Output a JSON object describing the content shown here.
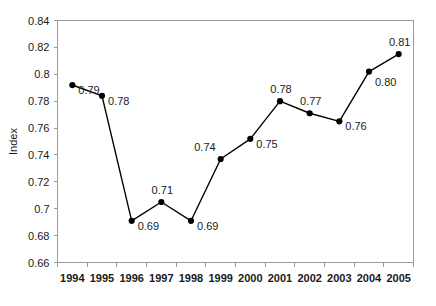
{
  "chart_data": {
    "type": "line",
    "title": "",
    "xlabel": "",
    "ylabel": "Index",
    "categories": [
      "1994",
      "1995",
      "1996",
      "1997",
      "1998",
      "1999",
      "2000",
      "2001",
      "2002",
      "2003",
      "2004",
      "2005"
    ],
    "values": [
      0.792,
      0.784,
      0.691,
      0.705,
      0.691,
      0.737,
      0.752,
      0.78,
      0.771,
      0.765,
      0.802,
      0.815
    ],
    "point_labels": [
      "0.79",
      "0.78",
      "0.69",
      "0.71",
      "0.69",
      "0.74",
      "0.75",
      "0.78",
      "0.77",
      "0.76",
      "0.80",
      "0.81"
    ],
    "label_positions": [
      "right",
      "right",
      "right",
      "above",
      "right",
      "above-left",
      "right",
      "above",
      "above",
      "right",
      "below-right",
      "above"
    ],
    "ylim": [
      0.66,
      0.84
    ],
    "ytick_step": 0.02,
    "ytick_labels": [
      "0.66",
      "0.68",
      "0.7",
      "0.72",
      "0.74",
      "0.76",
      "0.78",
      "0.8",
      "0.82",
      "0.84"
    ],
    "ytick_values": [
      0.66,
      0.68,
      0.7,
      0.72,
      0.74,
      0.76,
      0.78,
      0.8,
      0.82,
      0.84
    ],
    "grid": false,
    "legend": false,
    "legend_position": "none",
    "marker": "circle",
    "line_color": "#000000",
    "marker_color": "#000000",
    "axis_color": "#9a9a9a",
    "background_color": "#ffffff"
  }
}
